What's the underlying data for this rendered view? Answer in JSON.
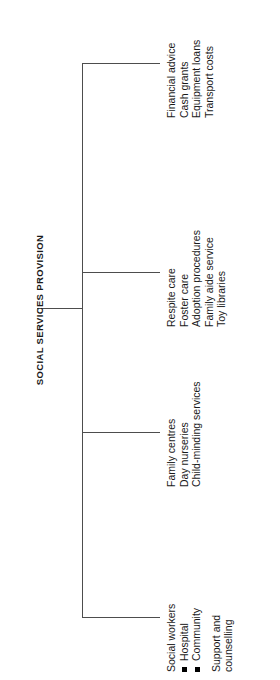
{
  "diagram": {
    "type": "tree",
    "orientation": "rotated-90-ccw",
    "root": {
      "label": "SOCIAL SERVICES PROVISION"
    },
    "line_color": "#4d4d4d",
    "bullet_color": "#000000",
    "branches": [
      {
        "id": "branch-social-workers",
        "items": [
          {
            "text": "Social workers",
            "bullet": false
          },
          {
            "text": "Hospital",
            "bullet": true
          },
          {
            "text": "Community",
            "bullet": true
          },
          {
            "text": "",
            "bullet": false,
            "spacer": true
          },
          {
            "text": "Support and",
            "bullet": false
          },
          {
            "text": "counselling",
            "bullet": false
          }
        ]
      },
      {
        "id": "branch-family-centres",
        "items": [
          {
            "text": "Family centres",
            "bullet": false
          },
          {
            "text": "Day nurseries",
            "bullet": false
          },
          {
            "text": "Child-minding services",
            "bullet": false
          }
        ]
      },
      {
        "id": "branch-respite-care",
        "items": [
          {
            "text": "Respite care",
            "bullet": false
          },
          {
            "text": "Foster care",
            "bullet": false
          },
          {
            "text": "Adoption procedures",
            "bullet": false
          },
          {
            "text": "Family aide service",
            "bullet": false
          },
          {
            "text": "Toy libraries",
            "bullet": false
          }
        ]
      },
      {
        "id": "branch-financial-advice",
        "items": [
          {
            "text": "Financial advice",
            "bullet": false
          },
          {
            "text": "Cash grants",
            "bullet": false
          },
          {
            "text": "Equipment loans",
            "bullet": false
          },
          {
            "text": "Transport costs",
            "bullet": false
          }
        ]
      }
    ]
  }
}
